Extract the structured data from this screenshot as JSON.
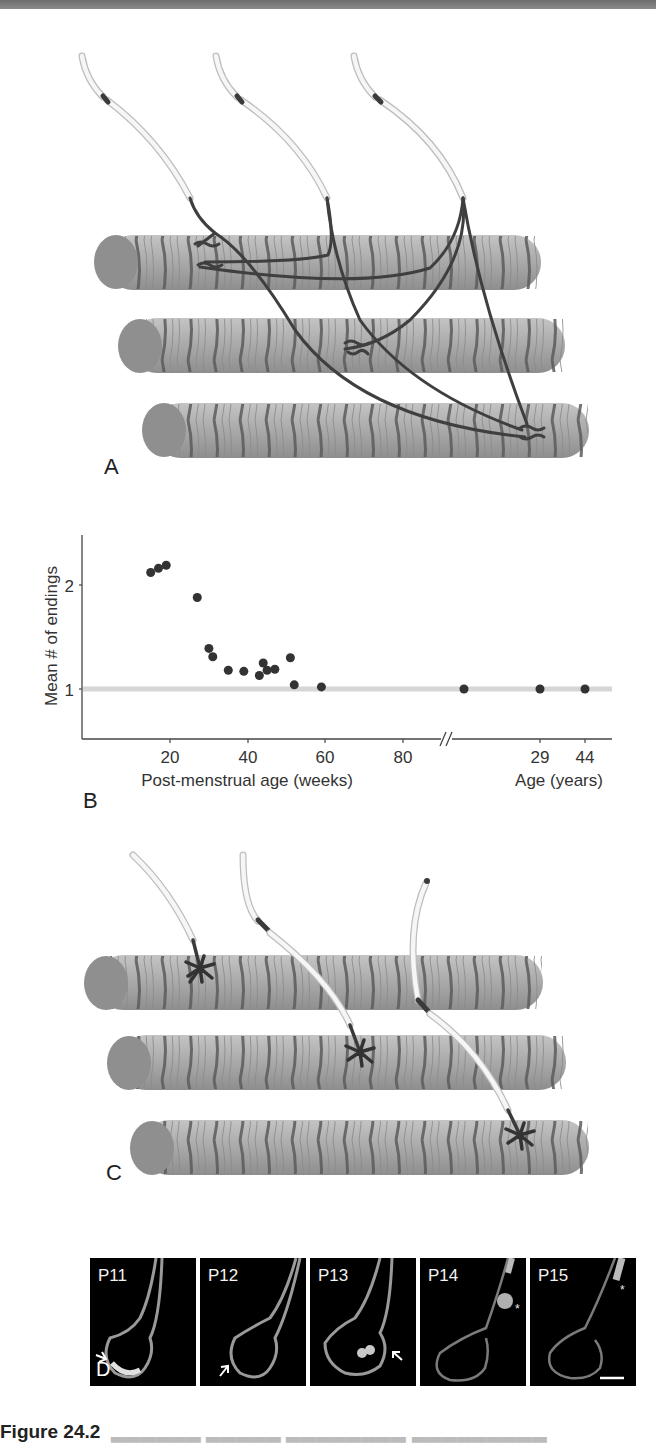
{
  "figure": {
    "panels": {
      "A": {
        "letter": "A",
        "description": "Polyneuronal innervation: three motor axons each branching to end on all three muscle fibers"
      },
      "B": {
        "letter": "B"
      },
      "C": {
        "letter": "C",
        "description": "Mono-innervation: each muscle fiber receives a single axon terminal"
      },
      "D": {
        "letter": "D",
        "frames": [
          {
            "label": "P11",
            "marker": "arrow"
          },
          {
            "label": "P12",
            "marker": "arrow"
          },
          {
            "label": "P13",
            "marker": "arrow"
          },
          {
            "label": "P14",
            "marker": "*"
          },
          {
            "label": "P15",
            "marker": "*"
          }
        ],
        "scale_bar": true
      }
    },
    "caption": {
      "label": "Figure 24.2",
      "text": "Elimination of synapses ... (text cut off)"
    }
  },
  "chart_data": {
    "type": "scatter",
    "title": "",
    "xlabel": "Post-menstrual age (weeks)",
    "xlabel_secondary": "Age (years)",
    "ylabel": "Mean # of endings",
    "x_ticks": [
      "20",
      "40",
      "60",
      "80"
    ],
    "x_ticks_secondary": [
      "29",
      "44"
    ],
    "y_ticks": [
      "1",
      "2"
    ],
    "axis_break": "//",
    "reference_line": {
      "y": 1,
      "color": "#d3d3d3"
    },
    "grid": false,
    "legend": null,
    "series": [
      {
        "name": "Post-menstrual age (weeks)",
        "points": [
          {
            "x": 15,
            "y": 2.12
          },
          {
            "x": 17,
            "y": 2.16
          },
          {
            "x": 19,
            "y": 2.19
          },
          {
            "x": 27,
            "y": 1.88
          },
          {
            "x": 30,
            "y": 1.39
          },
          {
            "x": 31,
            "y": 1.31
          },
          {
            "x": 35,
            "y": 1.18
          },
          {
            "x": 39,
            "y": 1.17
          },
          {
            "x": 44,
            "y": 1.25
          },
          {
            "x": 43,
            "y": 1.13
          },
          {
            "x": 45,
            "y": 1.18
          },
          {
            "x": 47,
            "y": 1.19
          },
          {
            "x": 51,
            "y": 1.3
          },
          {
            "x": 52,
            "y": 1.04
          },
          {
            "x": 59,
            "y": 1.02
          },
          {
            "x": 96,
            "y": 1.0
          }
        ]
      },
      {
        "name": "Age (years)",
        "points": [
          {
            "x": 29,
            "y": 1.0
          },
          {
            "x": 44,
            "y": 1.0
          }
        ]
      }
    ],
    "ylim": [
      0.5,
      2.5
    ]
  },
  "colors": {
    "fiber": "#a9a9a9",
    "fiber_end": "#8d8d8d",
    "band": "#5a5a5a",
    "axon_dark": "#3a3a3a",
    "myelin": "#f4f4f4",
    "point": "#333333",
    "refline": "#d6d6d6"
  }
}
